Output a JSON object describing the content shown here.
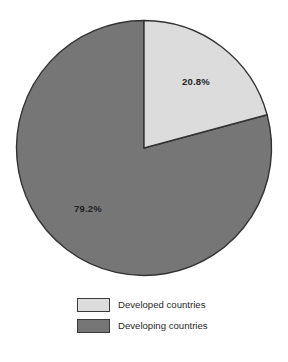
{
  "chart_data": {
    "type": "pie",
    "title": "",
    "categories": [
      "Developed countries",
      "Developing countries"
    ],
    "values": [
      20.8,
      79.2
    ],
    "value_labels": [
      "20.8%",
      "79.2%"
    ],
    "units": "percent",
    "start_angle_deg": 0,
    "direction": "clockwise",
    "legend_position": "bottom",
    "grid": false,
    "colors": [
      "#dcdcdc",
      "#767676"
    ],
    "edge_color": "#333333",
    "background": "#ffffff",
    "slices": [
      {
        "name": "Developed countries",
        "value": 20.8,
        "label": "20.8%",
        "color": "#dcdcdc",
        "start_angle_deg": 0,
        "sweep_deg": 74.88,
        "label_x": 196,
        "label_y": 85
      },
      {
        "name": "Developing countries",
        "value": 79.2,
        "label": "79.2%",
        "color": "#767676",
        "start_angle_deg": 74.88,
        "sweep_deg": 285.12,
        "label_x": 88,
        "label_y": 212
      }
    ]
  },
  "legend": {
    "items": [
      {
        "label": "Developed countries",
        "color": "#dcdcdc"
      },
      {
        "label": "Developing countries",
        "color": "#767676"
      }
    ]
  }
}
